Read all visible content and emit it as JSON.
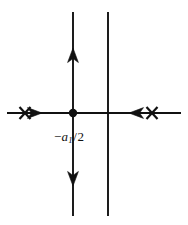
{
  "figure": {
    "background_color": "#ffffff",
    "stroke_color": "#111111",
    "width": 188,
    "height": 225
  },
  "axes": {
    "real_axis": {
      "name": "horizontal-axis",
      "x_start": 7,
      "x_end": 181,
      "y": 113
    },
    "asymptote_left": {
      "name": "vertical-line-left",
      "x": 73,
      "y_start": 12,
      "y_end": 216
    },
    "asymptote_right": {
      "name": "vertical-line-right",
      "x": 108,
      "y_start": 12,
      "y_end": 216
    }
  },
  "markers": {
    "breakaway_point": {
      "label_prefix": "−",
      "label_symbol": "a",
      "label_subscript": "1",
      "label_divider": "/",
      "label_denominator": "2",
      "label_full": "−a₁/2",
      "x": 73,
      "y": 113,
      "radius": 4.2
    },
    "poles": [
      {
        "name": "pole-left",
        "symbol": "x",
        "x": 25,
        "y": 113
      },
      {
        "name": "pole-right",
        "symbol": "x",
        "x": 152,
        "y": 113
      }
    ]
  },
  "direction_arrows": [
    {
      "name": "arrow-up",
      "direction": "up",
      "x": 73,
      "y": 55
    },
    {
      "name": "arrow-down",
      "direction": "down",
      "x": 73,
      "y": 180
    },
    {
      "name": "arrow-right",
      "direction": "right",
      "x": 40,
      "y": 113
    },
    {
      "name": "arrow-left",
      "direction": "left",
      "x": 131,
      "y": 113
    }
  ],
  "label": {
    "text": "−a₁/2",
    "x": 56,
    "y": 131
  }
}
